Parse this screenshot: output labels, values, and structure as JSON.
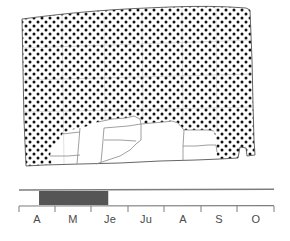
{
  "figure": {
    "type": "distribution-map-with-seasonal-bar",
    "background_color": "#ffffff"
  },
  "map": {
    "name": "North Dakota distribution map",
    "region_label": "North Dakota",
    "shading": {
      "pattern": "stipple-dots",
      "dot_color": "#111111",
      "dot_spacing_px": 4,
      "dot_radius_px": 1.25,
      "meaning": "occupied range"
    },
    "unshaded": {
      "fill_color": "#ffffff",
      "meaning": "unoccupied range"
    },
    "outline_color": "#555555",
    "county_line_color": "#888888"
  },
  "chart_data": {
    "type": "bar",
    "title": "",
    "xlabel": "",
    "ylabel": "",
    "orientation": "horizontal",
    "categories": [
      "A",
      "M",
      "Je",
      "Ju",
      "A",
      "S",
      "O"
    ],
    "category_full_names": [
      "April",
      "May",
      "June",
      "July",
      "August",
      "September",
      "October"
    ],
    "values": [
      1,
      1,
      1,
      0,
      0,
      0,
      0
    ],
    "xlim": [
      0,
      7
    ],
    "grid": false,
    "legend": null,
    "bars": [
      {
        "name": "occurrence-period",
        "start_category_index": 0.55,
        "end_category_index": 2.45,
        "start_label": "A",
        "end_label": "Je",
        "color": "#555555",
        "meaning": "period of occurrence"
      }
    ],
    "axis": {
      "line_color": "#777777",
      "tick_color": "#777777",
      "tick_count": 8,
      "tick_labels": [
        "A",
        "M",
        "Je",
        "Ju",
        "A",
        "S",
        "O"
      ],
      "top_rail": true
    }
  },
  "season_bar": {
    "months": [
      {
        "label": "A",
        "index": 0
      },
      {
        "label": "M",
        "index": 1
      },
      {
        "label": "Je",
        "index": 2
      },
      {
        "label": "Ju",
        "index": 3
      },
      {
        "label": "A",
        "index": 4
      },
      {
        "label": "S",
        "index": 5
      },
      {
        "label": "O",
        "index": 6
      }
    ],
    "bar_fill_color": "#555555",
    "rail_color": "#7d7d7d"
  }
}
